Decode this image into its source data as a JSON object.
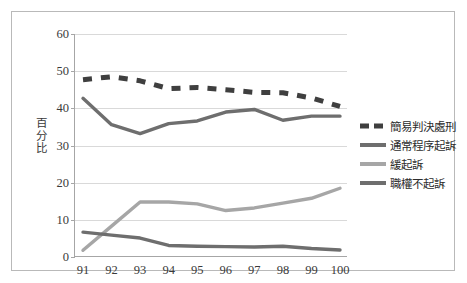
{
  "chart_data": {
    "type": "line",
    "title": "",
    "xlabel": "",
    "ylabel": "百分比",
    "categories": [
      "91",
      "92",
      "93",
      "94",
      "95",
      "96",
      "97",
      "98",
      "99",
      "100"
    ],
    "ylim": [
      0,
      60
    ],
    "yticks": [
      0,
      10,
      20,
      30,
      40,
      50,
      60
    ],
    "grid": true,
    "legend_position": "right",
    "series": [
      {
        "name": "簡易判決處刑",
        "color": "#3f3f3f",
        "style": "dashed",
        "values": [
          47.7,
          48.5,
          47.4,
          45.3,
          45.6,
          45.0,
          44.3,
          44.2,
          42.8,
          40.5
        ]
      },
      {
        "name": "通常程序起訴",
        "color": "#6e6e6e",
        "style": "solid",
        "values": [
          42.7,
          35.6,
          33.2,
          35.9,
          36.6,
          39.0,
          39.7,
          36.8,
          37.9,
          37.9
        ]
      },
      {
        "name": "緩起訴",
        "color": "#a6a6a6",
        "style": "solid",
        "values": [
          1.8,
          8.3,
          14.8,
          14.8,
          14.3,
          12.5,
          13.2,
          14.5,
          15.8,
          18.5
        ]
      },
      {
        "name": "職權不起訴",
        "color": "#6e6e6e",
        "style": "solid",
        "values": [
          6.7,
          5.9,
          5.1,
          3.1,
          2.9,
          2.8,
          2.7,
          2.9,
          2.3,
          1.9
        ]
      }
    ]
  },
  "legend": {
    "items": [
      {
        "label": "簡易判決處刑"
      },
      {
        "label": "通常程序起訴"
      },
      {
        "label": "緩起訴"
      },
      {
        "label": "職權不起訴"
      }
    ]
  },
  "axis": {
    "y_title_chars": [
      "百",
      "分",
      "比"
    ]
  }
}
